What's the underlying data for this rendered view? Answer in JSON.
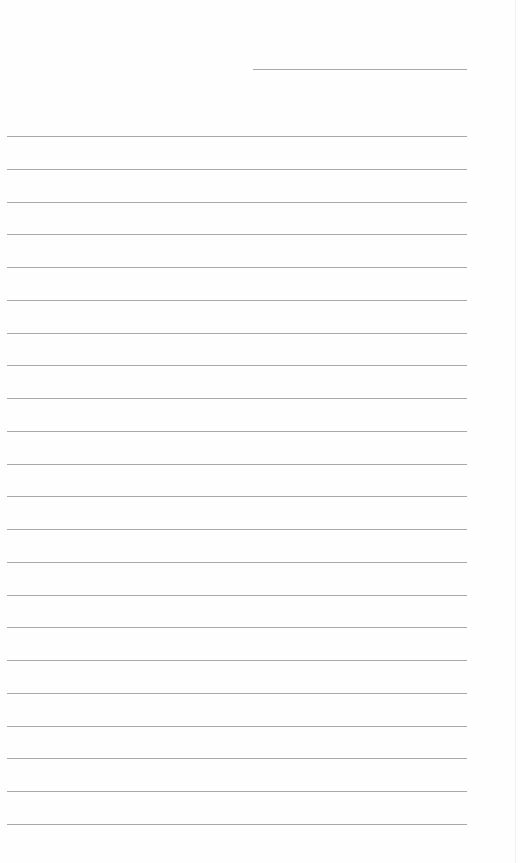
{
  "page": {
    "type": "lined-paper",
    "background": "#ffffff",
    "line_color": "#a9a9a9",
    "header_line": {
      "x": 253,
      "y": 69,
      "width": 214
    },
    "ruled_lines": {
      "count": 22,
      "start_y": 136,
      "spacing": 32.76,
      "x": 7,
      "width": 460
    }
  }
}
